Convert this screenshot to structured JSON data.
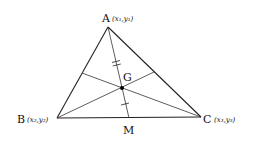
{
  "diagram": {
    "points": {
      "A": {
        "label": "A",
        "coord_label": "(x₁,y₁)"
      },
      "B": {
        "label": "B",
        "coord_label": "(x₂,y₂)"
      },
      "C": {
        "label": "C",
        "coord_label": "(x₃,y₃)"
      },
      "G": {
        "label": "G"
      },
      "M": {
        "label": "M"
      }
    },
    "relations": [
      "AM is a median (M midpoint of BC)",
      "G is the centroid (intersection of medians)",
      "AG marked with double tick, GM with single tick (AG:GM = 2:1)"
    ],
    "colors": {
      "stroke": "#222222",
      "point": "#000000"
    }
  }
}
